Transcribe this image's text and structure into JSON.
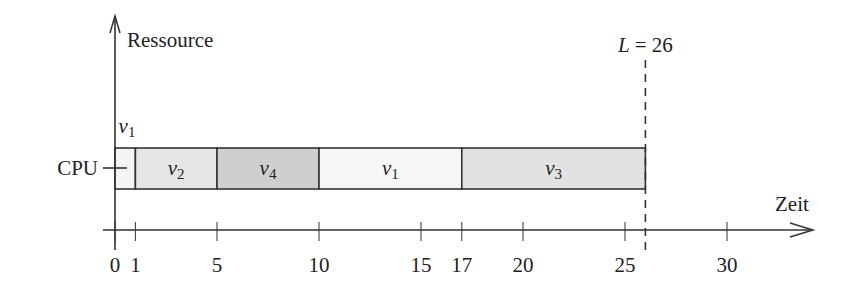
{
  "chart_data": {
    "type": "gantt",
    "title": "",
    "ylabel": "Ressource",
    "xlabel": "Zeit",
    "resources": [
      "CPU"
    ],
    "tasks": [
      {
        "name": "v1",
        "sub": "1",
        "start": 0,
        "end": 1,
        "fill": "#f4f4f4",
        "label_above": true
      },
      {
        "name": "v2",
        "sub": "2",
        "start": 1,
        "end": 5,
        "fill": "#e6e6e6"
      },
      {
        "name": "v4",
        "sub": "4",
        "start": 5,
        "end": 10,
        "fill": "#cfcfcf"
      },
      {
        "name": "v1",
        "sub": "1",
        "start": 10,
        "end": 17,
        "fill": "#f6f6f6"
      },
      {
        "name": "v3",
        "sub": "3",
        "start": 17,
        "end": 26,
        "fill": "#e2e2e2"
      }
    ],
    "x_ticks": [
      0,
      1,
      5,
      10,
      15,
      17,
      20,
      25,
      30
    ],
    "xlim": [
      0,
      33
    ],
    "deadline": {
      "label": "L = 26",
      "value": 26,
      "style": "dashed"
    }
  },
  "labels": {
    "y_axis": "Ressource",
    "x_axis": "Zeit",
    "resource": "CPU",
    "deadline_L": "L",
    "deadline_eq": "= 26",
    "v": "v",
    "ticks": [
      "0",
      "1",
      "5",
      "10",
      "15",
      "17",
      "20",
      "25",
      "30"
    ]
  }
}
